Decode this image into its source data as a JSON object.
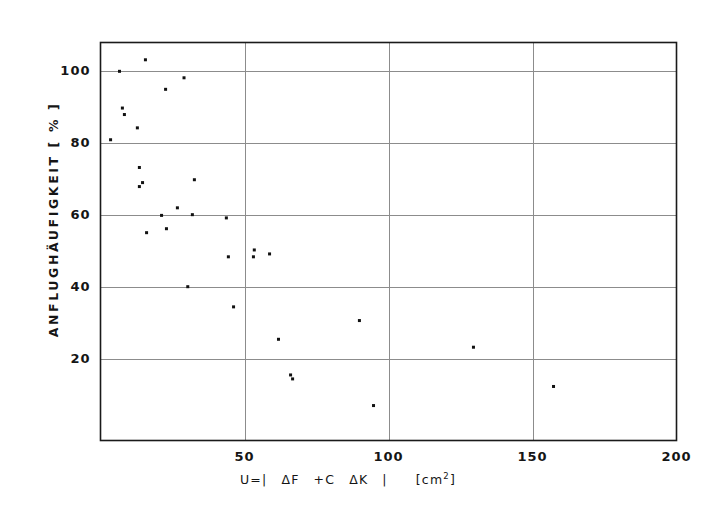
{
  "figure": {
    "background_color": "#ffffff",
    "frame_color": "#1a1a1a",
    "grid_color": "#8c8c8c",
    "marker_color": "#111111"
  },
  "axis_label_x_parts": {
    "lead": "U=|",
    "term1": "ΔF",
    "plus": "+C",
    "term2": "ΔK",
    "close": "|",
    "unit_open": "[cm",
    "unit_exp": "2",
    "unit_close": "]"
  },
  "chart_data": {
    "type": "scatter",
    "title": "",
    "xlabel": "U=|  ΔF  +C  ΔK  |   [cm²]",
    "ylabel": "ANFLUGHÄUFIGKEIT  [ % ]",
    "xlim": [
      0,
      200
    ],
    "ylim": [
      -2.5,
      108
    ],
    "grid": true,
    "legend": "none",
    "xticks": [
      50,
      100,
      150,
      200
    ],
    "xtick_labels": [
      "50",
      "100",
      "150",
      "200"
    ],
    "yticks": [
      20,
      40,
      60,
      80,
      100
    ],
    "ytick_labels": [
      "20",
      "40",
      "60",
      "80",
      "100"
    ],
    "marker": "square",
    "marker_size_px": 3,
    "points": [
      {
        "x": 15.6,
        "y": 103.2
      },
      {
        "x": 6.6,
        "y": 100.0
      },
      {
        "x": 29.0,
        "y": 98.2
      },
      {
        "x": 22.6,
        "y": 95.0
      },
      {
        "x": 7.6,
        "y": 89.8
      },
      {
        "x": 8.3,
        "y": 88.0
      },
      {
        "x": 12.8,
        "y": 84.3
      },
      {
        "x": 3.5,
        "y": 81.0
      },
      {
        "x": 13.5,
        "y": 73.3
      },
      {
        "x": 32.6,
        "y": 69.9
      },
      {
        "x": 14.6,
        "y": 69.1
      },
      {
        "x": 13.5,
        "y": 68.0
      },
      {
        "x": 26.7,
        "y": 62.1
      },
      {
        "x": 21.2,
        "y": 60.0
      },
      {
        "x": 31.9,
        "y": 60.2
      },
      {
        "x": 43.7,
        "y": 59.3
      },
      {
        "x": 22.9,
        "y": 56.3
      },
      {
        "x": 16.0,
        "y": 55.2
      },
      {
        "x": 53.4,
        "y": 50.4
      },
      {
        "x": 58.7,
        "y": 49.3
      },
      {
        "x": 53.1,
        "y": 48.5
      },
      {
        "x": 44.4,
        "y": 48.5
      },
      {
        "x": 30.3,
        "y": 40.2
      },
      {
        "x": 46.2,
        "y": 34.6
      },
      {
        "x": 89.9,
        "y": 30.8
      },
      {
        "x": 61.8,
        "y": 25.6
      },
      {
        "x": 129.5,
        "y": 23.4
      },
      {
        "x": 66.0,
        "y": 15.7
      },
      {
        "x": 66.7,
        "y": 14.6
      },
      {
        "x": 157.3,
        "y": 12.5
      },
      {
        "x": 94.8,
        "y": 7.2
      }
    ]
  }
}
